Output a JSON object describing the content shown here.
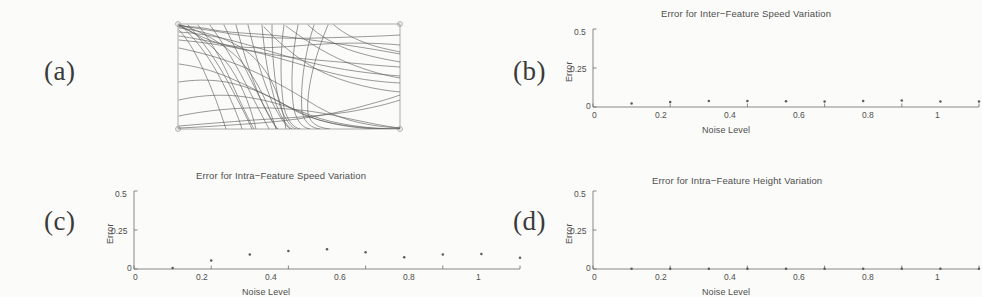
{
  "figure": {
    "panels": [
      {
        "tag": "(a)",
        "name": "trajectory-bundle"
      },
      {
        "tag": "(b)",
        "name": "inter-feature-speed"
      },
      {
        "tag": "(c)",
        "name": "intra-feature-speed"
      },
      {
        "tag": "(d)",
        "name": "intra-feature-height"
      }
    ]
  },
  "panel_a": {
    "label": "(a)",
    "description": "Bundle of overlapping curve trajectories inside a rectangular frame with corner markers"
  },
  "panel_b": {
    "label": "(b)",
    "title": "Error for Inter−Feature Speed Variation",
    "xlabel": "Noise Level",
    "ylabel": "Error",
    "xticks": [
      "0",
      "0.2",
      "0.4",
      "0.6",
      "0.8",
      "1"
    ],
    "yticks": [
      "0",
      "0.25",
      "0.5"
    ]
  },
  "panel_c": {
    "label": "(c)",
    "title": "Error for Intra−Feature Speed Variation",
    "xlabel": "Noise Level",
    "ylabel": "Error",
    "xticks": [
      "0",
      "0.2",
      "0.4",
      "0.6",
      "0.8",
      "1"
    ],
    "yticks": [
      "0",
      "0.25",
      "0.5"
    ]
  },
  "panel_d": {
    "label": "(d)",
    "title": "Error for Intra−Feature Height Variation",
    "xlabel": "Noise Level",
    "ylabel": "Error",
    "xticks": [
      "0",
      "0.2",
      "0.4",
      "0.6",
      "0.8",
      "1"
    ],
    "yticks": [
      "0",
      "0.25",
      "0.5"
    ]
  },
  "chart_data": [
    {
      "id": "panel_b",
      "type": "scatter",
      "title": "Error for Inter−Feature Speed Variation",
      "xlabel": "Noise Level",
      "ylabel": "Error",
      "xlim": [
        0,
        1
      ],
      "ylim": [
        0,
        0.5
      ],
      "xticks": [
        0,
        0.2,
        0.4,
        0.6,
        0.8,
        1
      ],
      "yticks": [
        0,
        0.25,
        0.5
      ],
      "grid": false,
      "legend": "none",
      "x": [
        0.1,
        0.2,
        0.3,
        0.4,
        0.5,
        0.6,
        0.7,
        0.8,
        0.9,
        1.0
      ],
      "values": [
        0.022,
        0.032,
        0.038,
        0.039,
        0.037,
        0.036,
        0.038,
        0.042,
        0.035,
        0.036
      ]
    },
    {
      "id": "panel_c",
      "type": "scatter",
      "title": "Error for Intra−Feature Speed Variation",
      "xlabel": "Noise Level",
      "ylabel": "Error",
      "xlim": [
        0,
        1
      ],
      "ylim": [
        0,
        0.5
      ],
      "xticks": [
        0,
        0.2,
        0.4,
        0.6,
        0.8,
        1
      ],
      "yticks": [
        0,
        0.25,
        0.5
      ],
      "grid": false,
      "legend": "none",
      "x": [
        0.1,
        0.2,
        0.3,
        0.4,
        0.5,
        0.6,
        0.7,
        0.8,
        0.9,
        1.0
      ],
      "values": [
        0.006,
        0.055,
        0.093,
        0.115,
        0.126,
        0.108,
        0.075,
        0.093,
        0.096,
        0.072
      ]
    },
    {
      "id": "panel_d",
      "type": "scatter",
      "title": "Error for Intra−Feature Height Variation",
      "xlabel": "Noise Level",
      "ylabel": "Error",
      "xlim": [
        0,
        1
      ],
      "ylim": [
        0,
        0.5
      ],
      "xticks": [
        0,
        0.2,
        0.4,
        0.6,
        0.8,
        1
      ],
      "yticks": [
        0,
        0.25,
        0.5
      ],
      "grid": false,
      "legend": "none",
      "x": [
        0.1,
        0.2,
        0.3,
        0.4,
        0.5,
        0.6,
        0.7,
        0.8,
        0.9,
        1.0
      ],
      "values": [
        0.002,
        0.002,
        0.002,
        0.002,
        0.002,
        0.002,
        0.002,
        0.002,
        0.002,
        0.002
      ]
    }
  ]
}
